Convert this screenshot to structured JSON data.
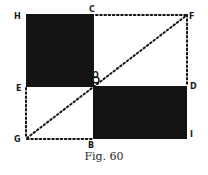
{
  "figure": {
    "caption": "Fig. 60",
    "colors": {
      "ink": "#141414",
      "background": "#ffffff"
    },
    "points": [
      {
        "name": "H",
        "x": 26,
        "y": 14
      },
      {
        "name": "C",
        "x": 94,
        "y": 14
      },
      {
        "name": "F",
        "x": 187,
        "y": 15
      },
      {
        "name": "E",
        "x": 26,
        "y": 87
      },
      {
        "name": "O",
        "x": 96,
        "y": 79
      },
      {
        "name": "D",
        "x": 187,
        "y": 86
      },
      {
        "name": "G",
        "x": 27,
        "y": 138
      },
      {
        "name": "B",
        "x": 93,
        "y": 139
      },
      {
        "name": "I",
        "x": 187,
        "y": 132
      }
    ],
    "shapes": [
      {
        "type": "filled-square",
        "corners": [
          "H",
          "C",
          "O",
          "E"
        ]
      },
      {
        "type": "filled-rectangle",
        "corners": [
          "O",
          "D",
          "I",
          "B"
        ]
      }
    ],
    "dotted_lines": [
      [
        "C",
        "F"
      ],
      [
        "F",
        "D"
      ],
      [
        "E",
        "G"
      ],
      [
        "G",
        "B"
      ],
      [
        "G",
        "F"
      ]
    ],
    "labels": {
      "H": "H",
      "C": "C",
      "F": "F",
      "E": "E",
      "O": "O",
      "D": "D",
      "G": "G",
      "B": "B",
      "I": "I"
    }
  }
}
